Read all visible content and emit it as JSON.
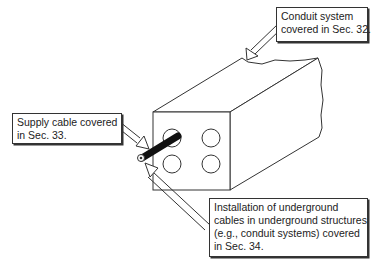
{
  "figure": {
    "colors": {
      "line": "#333333",
      "cable": "#111111",
      "background": "#ffffff"
    }
  },
  "callouts": {
    "conduit": {
      "lines": [
        "Conduit system",
        "covered in Sec. 32."
      ]
    },
    "supply_cable": {
      "lines": [
        "Supply cable covered",
        "in Sec. 33."
      ]
    },
    "installation": {
      "lines": [
        "Installation of underground",
        "cables in underground structures",
        "(e.g., conduit systems) covered",
        "in Sec. 34."
      ]
    }
  }
}
